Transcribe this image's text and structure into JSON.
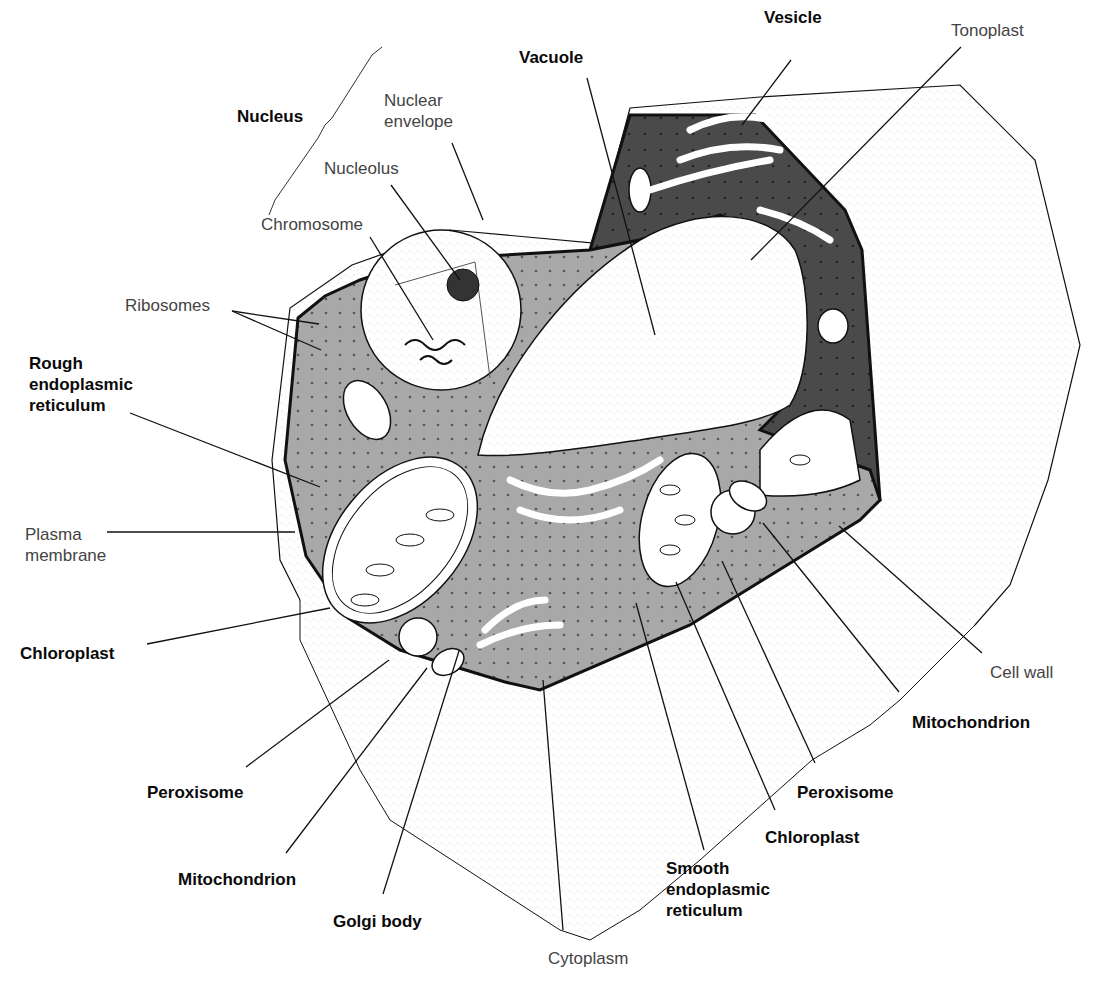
{
  "colors": {
    "background": "#ffffff",
    "cytoplasm": "#a8a8a8",
    "cytoplasm_dark": "#4a4a4a",
    "wall_fill": "#fbfbfb",
    "outline": "#111111",
    "organelle_fill": "#ffffff",
    "label_bold": "#0a0a0a",
    "label_light": "#444444"
  },
  "labels": [
    {
      "id": "nucleus",
      "text": "Nucleus",
      "style": "bold",
      "x": 237,
      "y": 106
    },
    {
      "id": "nuclear-envelope",
      "text": "Nuclear\nenvelope",
      "style": "light",
      "x": 384,
      "y": 90
    },
    {
      "id": "nucleolus",
      "text": "Nucleolus",
      "style": "light",
      "x": 324,
      "y": 158
    },
    {
      "id": "chromosome",
      "text": "Chromosome",
      "style": "light",
      "x": 261,
      "y": 214
    },
    {
      "id": "vacuole",
      "text": "Vacuole",
      "style": "bold",
      "x": 519,
      "y": 47
    },
    {
      "id": "vesicle",
      "text": "Vesicle",
      "style": "bold",
      "x": 764,
      "y": 7
    },
    {
      "id": "tonoplast",
      "text": "Tonoplast",
      "style": "light",
      "x": 951,
      "y": 20
    },
    {
      "id": "ribosomes",
      "text": "Ribosomes",
      "style": "light",
      "x": 125,
      "y": 295
    },
    {
      "id": "rough-er",
      "text": "Rough\nendoplasmic\nreticulum",
      "style": "bold",
      "x": 29,
      "y": 353
    },
    {
      "id": "plasma-membrane",
      "text": "Plasma\nmembrane",
      "style": "light",
      "x": 25,
      "y": 524
    },
    {
      "id": "chloroplast-left",
      "text": "Chloroplast",
      "style": "bold",
      "x": 20,
      "y": 643
    },
    {
      "id": "cell-wall",
      "text": "Cell wall",
      "style": "light",
      "x": 990,
      "y": 662
    },
    {
      "id": "mitochondrion-right",
      "text": "Mitochondrion",
      "style": "bold",
      "x": 912,
      "y": 712
    },
    {
      "id": "peroxisome-right",
      "text": "Peroxisome",
      "style": "bold",
      "x": 797,
      "y": 782
    },
    {
      "id": "chloroplast-right",
      "text": "Chloroplast",
      "style": "bold",
      "x": 765,
      "y": 827
    },
    {
      "id": "peroxisome-left",
      "text": "Peroxisome",
      "style": "bold",
      "x": 147,
      "y": 782
    },
    {
      "id": "mitochondrion-left",
      "text": "Mitochondrion",
      "style": "bold",
      "x": 178,
      "y": 869
    },
    {
      "id": "smooth-er",
      "text": "Smooth\nendoplasmic\nreticulum",
      "style": "bold",
      "x": 666,
      "y": 858
    },
    {
      "id": "golgi-body",
      "text": "Golgi body",
      "style": "bold",
      "x": 333,
      "y": 911
    },
    {
      "id": "cytoplasm",
      "text": "Cytoplasm",
      "style": "light",
      "x": 548,
      "y": 948
    }
  ],
  "leaders": [
    {
      "for": "nuclear-envelope",
      "points": [
        [
          452,
          143
        ],
        [
          483,
          220
        ]
      ]
    },
    {
      "for": "nucleolus",
      "points": [
        [
          391,
          185
        ],
        [
          460,
          280
        ]
      ]
    },
    {
      "for": "chromosome",
      "points": [
        [
          370,
          237
        ],
        [
          433,
          340
        ]
      ]
    },
    {
      "for": "vacuole",
      "points": [
        [
          587,
          78
        ],
        [
          655,
          335
        ]
      ]
    },
    {
      "for": "vesicle",
      "points": [
        [
          791,
          60
        ],
        [
          742,
          125
        ]
      ]
    },
    {
      "for": "tonoplast",
      "points": [
        [
          961,
          47
        ],
        [
          751,
          260
        ]
      ]
    },
    {
      "for": "ribosomes-1",
      "points": [
        [
          232,
          311
        ],
        [
          319,
          324
        ]
      ]
    },
    {
      "for": "ribosomes-2",
      "points": [
        [
          232,
          311
        ],
        [
          321,
          350
        ]
      ]
    },
    {
      "for": "rough-er",
      "points": [
        [
          130,
          413
        ],
        [
          320,
          487
        ]
      ]
    },
    {
      "for": "plasma-membrane",
      "points": [
        [
          107,
          532
        ],
        [
          295,
          532
        ]
      ]
    },
    {
      "for": "chloroplast-left",
      "points": [
        [
          147,
          644
        ],
        [
          330,
          608
        ]
      ]
    },
    {
      "for": "cell-wall",
      "points": [
        [
          982,
          653
        ],
        [
          839,
          526
        ]
      ]
    },
    {
      "for": "mitochondrion-right",
      "points": [
        [
          899,
          692
        ],
        [
          763,
          523
        ]
      ]
    },
    {
      "for": "peroxisome-right",
      "points": [
        [
          815,
          763
        ],
        [
          722,
          561
        ]
      ]
    },
    {
      "for": "chloroplast-right",
      "points": [
        [
          775,
          810
        ],
        [
          676,
          582
        ]
      ]
    },
    {
      "for": "smooth-er",
      "points": [
        [
          704,
          850
        ],
        [
          636,
          603
        ]
      ]
    },
    {
      "for": "peroxisome-left",
      "points": [
        [
          246,
          767
        ],
        [
          389,
          660
        ]
      ]
    },
    {
      "for": "mitochondrion-left",
      "points": [
        [
          286,
          853
        ],
        [
          427,
          668
        ]
      ]
    },
    {
      "for": "golgi-body",
      "points": [
        [
          383,
          894
        ],
        [
          459,
          651
        ]
      ]
    },
    {
      "for": "cytoplasm",
      "points": [
        [
          563,
          930
        ],
        [
          543,
          680
        ]
      ]
    }
  ],
  "nucleus_brace": {
    "points": [
      [
        269,
        215
      ],
      [
        275,
        200
      ],
      [
        318,
        138
      ],
      [
        325,
        125
      ],
      [
        332,
        118
      ],
      [
        372,
        55
      ],
      [
        382,
        47
      ]
    ]
  },
  "shapes": {
    "outer_cell_wall_front": [
      [
        290,
        308
      ],
      [
        302,
        290
      ],
      [
        352,
        265
      ],
      [
        450,
        230
      ],
      [
        594,
        243
      ],
      [
        630,
        108
      ],
      [
        760,
        97
      ],
      [
        940,
        83
      ],
      [
        960,
        85
      ],
      [
        1035,
        160
      ],
      [
        1080,
        345
      ],
      [
        1048,
        480
      ],
      [
        1010,
        585
      ],
      [
        975,
        625
      ],
      [
        830,
        715
      ],
      [
        700,
        810
      ],
      [
        588,
        880
      ],
      [
        572,
        890
      ],
      [
        552,
        882
      ],
      [
        430,
        830
      ],
      [
        390,
        730
      ],
      [
        350,
        680
      ],
      [
        300,
        600
      ],
      [
        280,
        560
      ],
      [
        272,
        460
      ]
    ],
    "cytoplasm_region": [
      [
        298,
        318
      ],
      [
        325,
        296
      ],
      [
        360,
        280
      ],
      [
        420,
        260
      ],
      [
        590,
        250
      ],
      [
        630,
        115
      ],
      [
        755,
        115
      ],
      [
        845,
        210
      ],
      [
        862,
        250
      ],
      [
        880,
        500
      ],
      [
        860,
        520
      ],
      [
        690,
        625
      ],
      [
        540,
        690
      ],
      [
        505,
        682
      ],
      [
        400,
        650
      ],
      [
        348,
        618
      ],
      [
        306,
        556
      ],
      [
        285,
        460
      ]
    ],
    "vacuole": [
      [
        478,
        455
      ],
      [
        505,
        385
      ],
      [
        560,
        300
      ],
      [
        625,
        245
      ],
      [
        690,
        215
      ],
      [
        745,
        215
      ],
      [
        790,
        245
      ],
      [
        800,
        290
      ],
      [
        805,
        340
      ],
      [
        800,
        390
      ],
      [
        770,
        420
      ],
      [
        720,
        430
      ],
      [
        640,
        440
      ],
      [
        560,
        450
      ],
      [
        510,
        462
      ]
    ],
    "nucleus_circle": {
      "cx": 441,
      "cy": 310,
      "r": 80
    }
  }
}
